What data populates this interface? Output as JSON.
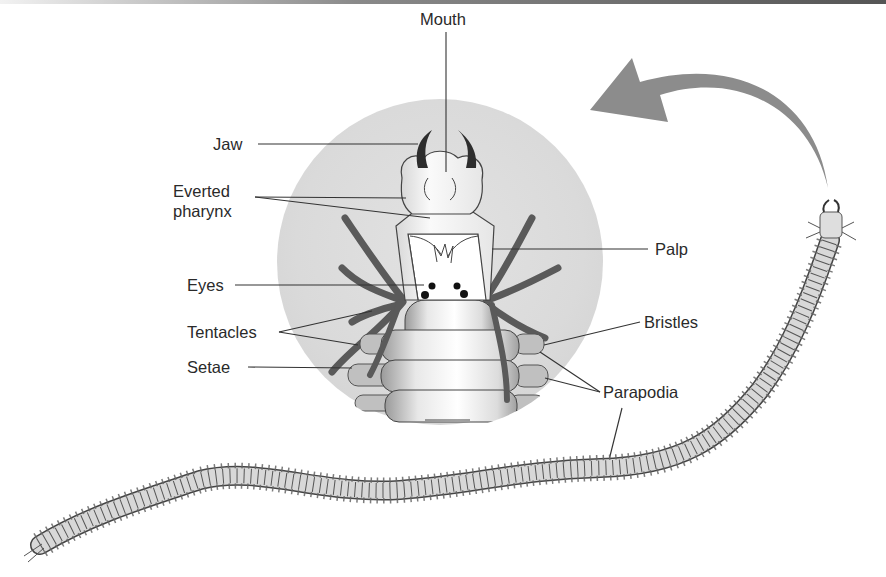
{
  "figure": {
    "labels": {
      "mouth": "Mouth",
      "jaw": "Jaw",
      "everted_pharynx_line1": "Everted",
      "everted_pharynx_line2": "pharynx",
      "palp": "Palp",
      "eyes": "Eyes",
      "tentacles": "Tentacles",
      "setae": "Setae",
      "bristles": "Bristles",
      "parapodia": "Parapodia"
    },
    "colors": {
      "background": "#ffffff",
      "magnifier_circle": "#dcdcdc",
      "arrow": "#8c8c8c",
      "outline": "#3a3a3a",
      "tentacle": "#555555",
      "body_segment": "#d6d6d6",
      "label_text": "#2a2a2a"
    }
  }
}
